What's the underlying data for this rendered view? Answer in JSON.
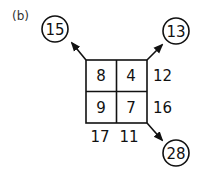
{
  "panel_label": "(b)",
  "grid": {
    "cells": [
      [
        "8",
        "4"
      ],
      [
        "9",
        "7"
      ]
    ],
    "row_sums": [
      "12",
      "16"
    ],
    "col_sums": [
      "17",
      "11"
    ]
  },
  "diagonals": {
    "top_left": "15",
    "top_right": "13",
    "bottom_right": "28"
  },
  "colors": {
    "stroke": "#111111",
    "background": "#ffffff"
  }
}
